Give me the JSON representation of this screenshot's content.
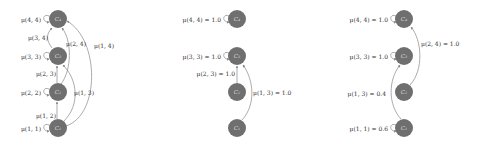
{
  "colors": {
    "node": "#6f6f6f",
    "edge": "#888888",
    "label": "#333333",
    "node_label": "#d8d8d8"
  },
  "panels": [
    {
      "name": "full-transition-graph",
      "cx": 58,
      "nodes": [
        {
          "id": "C1",
          "label": "C₁",
          "y": 128
        },
        {
          "id": "C2",
          "label": "C₂",
          "y": 92
        },
        {
          "id": "C3",
          "label": "C₃",
          "y": 56
        },
        {
          "id": "C4",
          "label": "C₄",
          "y": 19
        }
      ],
      "self_loops": [
        {
          "label": "μ(1, 1)",
          "node": 0
        },
        {
          "label": "μ(2, 2)",
          "node": 1
        },
        {
          "label": "μ(3, 3)",
          "node": 2
        },
        {
          "label": "μ(4, 4)",
          "node": 3
        }
      ],
      "edges": [
        {
          "label": "μ(1, 2)",
          "from": 0,
          "to": 1
        },
        {
          "label": "μ(2, 3)",
          "from": 1,
          "to": 2
        },
        {
          "label": "μ(3, 4)",
          "from": 2,
          "to": 3
        },
        {
          "label": "μ(1, 3)",
          "from": 0,
          "to": 2
        },
        {
          "label": "μ(2, 4)",
          "from": 1,
          "to": 3
        },
        {
          "label": "μ(1, 4)",
          "from": 0,
          "to": 3
        }
      ]
    },
    {
      "name": "example-transition-graph-a",
      "cx": 237,
      "nodes": [
        {
          "id": "C1",
          "label": "C₁",
          "y": 128
        },
        {
          "id": "C2",
          "label": "C₂",
          "y": 92
        },
        {
          "id": "C3",
          "label": "C₃",
          "y": 56
        },
        {
          "id": "C4",
          "label": "C₄",
          "y": 19
        }
      ],
      "self_loops": [
        {
          "label": "μ(3, 3) = 1.0",
          "node": 2
        },
        {
          "label": "μ(4, 4) = 1.0",
          "node": 3
        }
      ],
      "edges": [
        {
          "label": "μ(2, 3) = 1.0",
          "from": 1,
          "to": 2
        },
        {
          "label": "μ(1, 3) = 1.0",
          "from": 0,
          "to": 2
        }
      ]
    },
    {
      "name": "example-transition-graph-b",
      "cx": 404,
      "nodes": [
        {
          "id": "C1",
          "label": "C₁",
          "y": 128
        },
        {
          "id": "C2",
          "label": "C₂",
          "y": 92
        },
        {
          "id": "C3",
          "label": "C₃",
          "y": 56
        },
        {
          "id": "C4",
          "label": "C₄",
          "y": 19
        }
      ],
      "self_loops": [
        {
          "label": "μ(1, 1) = 0.6",
          "node": 0
        },
        {
          "label": "μ(3, 3) = 1.0",
          "node": 2
        },
        {
          "label": "μ(4, 4) = 1.0",
          "node": 3
        }
      ],
      "edges": [
        {
          "label": "μ(1, 3) = 0.4",
          "from": 0,
          "to": 2
        },
        {
          "label": "μ(2, 4) = 1.0",
          "from": 1,
          "to": 3
        }
      ]
    }
  ]
}
